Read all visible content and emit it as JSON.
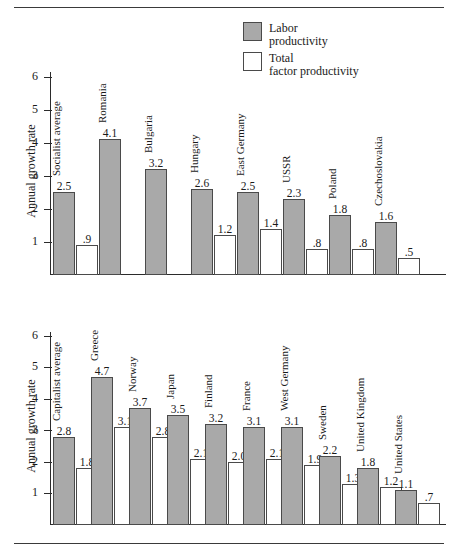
{
  "figure": {
    "rule_top_label": "top-divider",
    "rule_bottom_label": "bottom-divider"
  },
  "legend": {
    "items": [
      {
        "key": "labor",
        "line1": "Labor",
        "line2": "productivity",
        "color": "#a9a9a9"
      },
      {
        "key": "tfp",
        "line1": "Total",
        "line2": "factor productivity",
        "color": "#ffffff"
      }
    ]
  },
  "chart_data": [
    {
      "id": "socialist",
      "type": "bar",
      "title": "",
      "xlabel": "",
      "ylabel": "Annual growth rate",
      "ylim": [
        0,
        6.5
      ],
      "yticks": [
        1,
        2,
        3,
        4,
        5,
        6
      ],
      "ytick_labels": [
        "1",
        "2",
        "3",
        "4",
        "5",
        "6"
      ],
      "grid": false,
      "legend_position": "top-right",
      "categories": [
        "Socialist average",
        "Romania",
        "Bulgaria",
        "Hungary",
        "East Germany",
        "USSR",
        "Poland",
        "Czechoslovakia"
      ],
      "series": [
        {
          "name": "Labor productivity",
          "color": "#a9a9a9",
          "values": [
            2.5,
            4.1,
            3.2,
            2.6,
            2.5,
            2.3,
            1.8,
            1.6
          ],
          "labels": [
            "2.5",
            "4.1",
            "3.2",
            "2.6",
            "2.5",
            "2.3",
            "1.8",
            "1.6"
          ]
        },
        {
          "name": "Total factor productivity",
          "color": "#ffffff",
          "values": [
            0.9,
            null,
            null,
            1.2,
            1.4,
            0.8,
            0.8,
            0.5
          ],
          "labels": [
            ".9",
            "",
            "",
            "1.2",
            "1.4",
            ".8",
            ".8",
            ".5"
          ]
        }
      ]
    },
    {
      "id": "capitalist",
      "type": "bar",
      "title": "",
      "xlabel": "",
      "ylabel": "Annual growth rate",
      "ylim": [
        0,
        6.5
      ],
      "yticks": [
        1,
        2,
        3,
        4,
        5,
        6
      ],
      "ytick_labels": [
        "1",
        "2",
        "3",
        "4",
        "5",
        "6"
      ],
      "grid": false,
      "legend_position": "none",
      "categories": [
        "Capitalist average",
        "Greece",
        "Norway",
        "Japan",
        "Finland",
        "France",
        "West Germany",
        "Sweden",
        "United Kingdom",
        "United States"
      ],
      "series": [
        {
          "name": "Labor productivity",
          "color": "#a9a9a9",
          "values": [
            2.8,
            4.7,
            3.7,
            3.5,
            3.2,
            3.1,
            3.1,
            2.2,
            1.8,
            1.1
          ],
          "labels": [
            "2.8",
            "4.7",
            "3.7",
            "3.5",
            "3.2",
            "3.1",
            "3.1",
            "2.2",
            "1.8",
            "1.1"
          ]
        },
        {
          "name": "Total factor productivity",
          "color": "#ffffff",
          "values": [
            1.8,
            3.1,
            2.8,
            2.1,
            2.0,
            2.1,
            1.9,
            1.3,
            1.2,
            0.7
          ],
          "labels": [
            "1.8",
            "3.1",
            "2.8",
            "2.1",
            "2.0",
            "2.1",
            "1.9",
            "1.3",
            "1.2",
            ".7"
          ]
        }
      ]
    }
  ]
}
